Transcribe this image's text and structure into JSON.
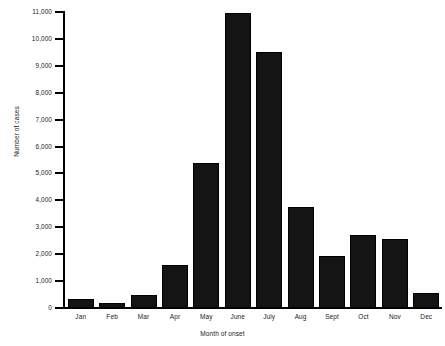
{
  "chart_data": {
    "type": "bar",
    "title": "",
    "xlabel": "Month of onset",
    "ylabel": "Number of cases",
    "categories": [
      "Jan",
      "Feb",
      "Mar",
      "Apr",
      "May",
      "June",
      "July",
      "Aug",
      "Sept",
      "Oct",
      "Nov",
      "Dec"
    ],
    "values": [
      320,
      180,
      480,
      1580,
      5400,
      10950,
      9500,
      3750,
      1950,
      2700,
      2580,
      570
    ],
    "series": [
      {
        "name": "Number of cases",
        "values": [
          320,
          180,
          480,
          1580,
          5400,
          10950,
          9500,
          3750,
          1950,
          2700,
          2580,
          570
        ]
      }
    ],
    "ylim": [
      0,
      11000
    ],
    "ytick_values": [
      0,
      1000,
      2000,
      3000,
      4000,
      5000,
      6000,
      7000,
      8000,
      9000,
      10000,
      11000
    ],
    "ytick_labels": [
      "0",
      "1,000",
      "2,000",
      "3,000",
      "4,000",
      "5,000",
      "6,000",
      "7,000",
      "8,000",
      "9,000",
      "10,000",
      "11,000"
    ],
    "grid": false,
    "legend": null,
    "bar_color": "#141414",
    "axis_color": "#000000",
    "background_color": "#ffffff"
  }
}
